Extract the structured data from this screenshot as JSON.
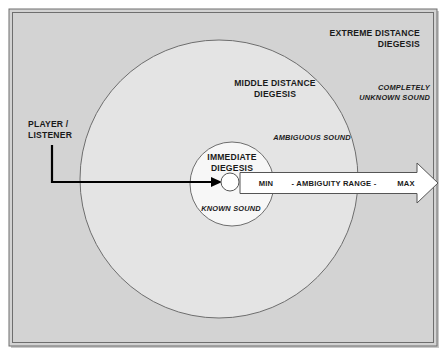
{
  "diagram": {
    "title_visible": false,
    "zones": [
      {
        "id": "extreme",
        "label_line1": "EXTREME DISTANCE",
        "label_line2": "DIEGESIS",
        "sound_line1": "COMPLETELY",
        "sound_line2": "UNKNOWN SOUND",
        "fill": "#d3d3d3"
      },
      {
        "id": "middle",
        "label_line1": "MIDDLE DISTANCE",
        "label_line2": "DIEGESIS",
        "sound_line1": "AMBIGUOUS SOUND",
        "fill": "#e6e6e6"
      },
      {
        "id": "immediate",
        "label_line1": "IMMEDIATE",
        "label_line2": "DIEGESIS",
        "sound_line1": "KNOWN SOUND",
        "fill": "#f7f7f7"
      }
    ],
    "player": {
      "label_line1": "PLAYER /",
      "label_line2": "LISTENER"
    },
    "arrow": {
      "min_label": "MIN",
      "range_label": "- AMBIGUITY RANGE -",
      "max_label": "MAX",
      "fill": "#ffffff",
      "stroke": "#555555"
    },
    "colors": {
      "page_background": "#ffffff",
      "frame_fill": "#d3d3d3",
      "frame_stroke": "#6e6e6e",
      "circle_stroke": "#6e6e6e",
      "text": "#1a1a1a",
      "leader_line": "#000000"
    }
  }
}
